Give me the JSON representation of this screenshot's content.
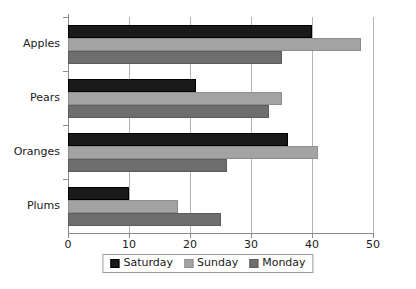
{
  "chart_data": {
    "type": "bar",
    "orientation": "horizontal",
    "title": "",
    "subtitle": "",
    "xlabel": "",
    "ylabel": "",
    "categories": [
      "Apples",
      "Pears",
      "Oranges",
      "Plums"
    ],
    "series": [
      {
        "name": "Saturday",
        "color": "#1a1a1a",
        "values": [
          40,
          21,
          36,
          10
        ]
      },
      {
        "name": "Sunday",
        "color": "#a3a3a3",
        "values": [
          48,
          35,
          41,
          18
        ]
      },
      {
        "name": "Monday",
        "color": "#6e6e6e",
        "values": [
          35,
          33,
          26,
          25
        ]
      }
    ],
    "xlim": [
      0,
      50
    ],
    "xticks": [
      0,
      10,
      20,
      30,
      40,
      50
    ],
    "xtick_labels": [
      "0",
      "10",
      "20",
      "30",
      "40",
      "50"
    ],
    "grid": "vertical",
    "legend_position": "bottom-center",
    "background_color": "#ffffff",
    "axis_color": "#8a8a8a",
    "gridline_color": "#b4b4b4",
    "text_color": "#1a1a1a"
  }
}
